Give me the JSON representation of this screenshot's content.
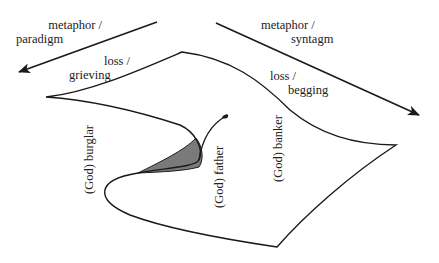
{
  "diagram": {
    "type": "warped surface with directional arrows",
    "colors": {
      "stroke": "#1a1a1a",
      "fill_shaded": "#7a7a7a",
      "text": "#222222",
      "background": "#ffffff"
    },
    "arrows": [
      {
        "id": "left",
        "line1": "metaphor /",
        "line2": "paradigm",
        "direction": "down-left"
      },
      {
        "id": "right",
        "line1": "metaphor /",
        "line2": "syntagm",
        "direction": "down-right"
      }
    ],
    "edge_labels": [
      {
        "id": "grieving",
        "line1": "loss /",
        "line2": "grieving"
      },
      {
        "id": "begging",
        "line1": "loss /",
        "line2": "begging"
      }
    ],
    "vertical_labels": [
      {
        "id": "burglar",
        "text": "(God) burglar"
      },
      {
        "id": "father",
        "text": "(God) father"
      },
      {
        "id": "banker",
        "text": "(God) banker"
      }
    ]
  }
}
